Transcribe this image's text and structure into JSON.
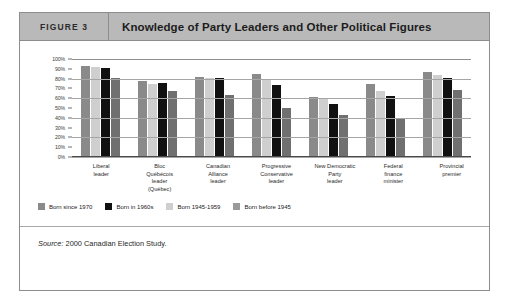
{
  "figure": {
    "number_label": "FIGURE 3",
    "title": "Knowledge of Party Leaders and Other Political Figures"
  },
  "source": {
    "prefix": "Source:",
    "text": " 2000 Canadian Election Study."
  },
  "chart_data": {
    "type": "bar",
    "title": "Knowledge of Party Leaders and Other Political Figures",
    "xlabel": "",
    "ylabel": "",
    "ylim": [
      0,
      100
    ],
    "grid": true,
    "legend_position": "bottom-left",
    "y_ticks": [
      "0%",
      "10%",
      "20%",
      "30%",
      "40%",
      "50%",
      "60%",
      "70%",
      "80%",
      "90%",
      "100%"
    ],
    "y_tick_values": [
      0,
      10,
      20,
      30,
      40,
      50,
      60,
      70,
      80,
      90,
      100
    ],
    "categories": [
      "Liberal leader",
      "Bloc Québécois leader (Québec)",
      "Canadian Alliance leader",
      "Progressive Conservative leader",
      "New Democratic Party leader",
      "Federal finance minister",
      "Provincial premier"
    ],
    "category_lines": [
      [
        "Liberal",
        "leader"
      ],
      [
        "Bloc",
        "Québécois",
        "leader",
        "(Québec)"
      ],
      [
        "Canadian",
        "Alliance",
        "leader"
      ],
      [
        "Progressive",
        "Conservative",
        "leader"
      ],
      [
        "New Democratic",
        "Party",
        "leader"
      ],
      [
        "Federal",
        "finance",
        "minister"
      ],
      [
        "Provincial",
        "premier"
      ]
    ],
    "series": [
      {
        "name": "Born since 1970",
        "color": "#8a8a8a",
        "values": [
          93,
          78,
          82,
          85,
          61,
          75,
          87
        ]
      },
      {
        "name": "Born in 1960s",
        "color": "#111111",
        "values": [
          91,
          76,
          81,
          73,
          54,
          62,
          81
        ]
      },
      {
        "name": "Born 1945-1959",
        "color": "#cfcfcf",
        "values": [
          92,
          74,
          81,
          80,
          60,
          67,
          84
        ]
      },
      {
        "name": "Born before 1945",
        "color": "#707070",
        "values": [
          81,
          67,
          63,
          50,
          43,
          40,
          68
        ]
      }
    ],
    "bar_draw_order": [
      "Born since 1970",
      "Born 1945-1959",
      "Born in 1960s",
      "Born before 1945"
    ],
    "legend": [
      {
        "label": "Born since 1970",
        "color": "#8a8a8a"
      },
      {
        "label": "Born in 1960s",
        "color": "#111111"
      },
      {
        "label": "Born 1945-1959",
        "color": "#cfcfcf"
      },
      {
        "label": "Born before 1945",
        "color": "#9a9a9a"
      }
    ]
  }
}
